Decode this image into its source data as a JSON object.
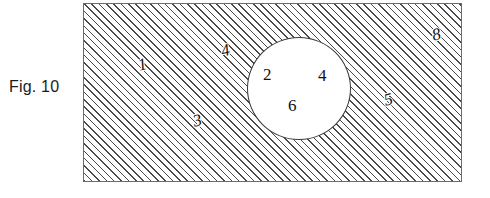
{
  "figure": {
    "caption": "Fig. 10",
    "background_color": "#ffffff",
    "line_color": "#4a4a4a",
    "text_color": "#111111"
  },
  "hatched_region": {
    "name": "cross-hatched body",
    "fill": "diagonal-hatch-45deg",
    "border_color": "#6b6b6b"
  },
  "circle_region": {
    "name": "white circular bore",
    "fill": "#ffffff",
    "border_color": "#3a3a3a"
  },
  "reference_numerals": [
    {
      "id": "label-1",
      "text": "1",
      "location": "hatched-left",
      "slanted": true,
      "inside_circle": false
    },
    {
      "id": "label-4a",
      "text": "4",
      "location": "hatched-upper-middle",
      "slanted": true,
      "inside_circle": false
    },
    {
      "id": "label-3",
      "text": "3",
      "location": "hatched-lower-left",
      "slanted": true,
      "inside_circle": false
    },
    {
      "id": "label-2",
      "text": "2",
      "location": "circle-left",
      "slanted": false,
      "inside_circle": true
    },
    {
      "id": "label-4b",
      "text": "4",
      "location": "circle-right",
      "slanted": false,
      "inside_circle": true
    },
    {
      "id": "label-6",
      "text": "6",
      "location": "circle-bottom",
      "slanted": false,
      "inside_circle": true
    },
    {
      "id": "label-5",
      "text": "5",
      "location": "hatched-right",
      "slanted": true,
      "inside_circle": false
    },
    {
      "id": "label-8",
      "text": "8",
      "location": "hatched-top-right",
      "slanted": true,
      "inside_circle": false
    }
  ]
}
